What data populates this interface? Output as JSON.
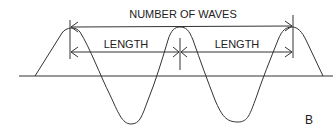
{
  "diagram": {
    "title": "NUMBER OF WAVES",
    "length_left": "LENGTH",
    "length_right": "LENGTH",
    "panel_label": "B",
    "stroke_color": "#222222",
    "background": "#ffffff"
  }
}
